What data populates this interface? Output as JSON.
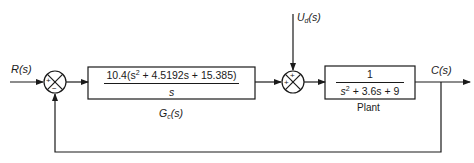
{
  "diagram": {
    "type": "block-diagram",
    "input": {
      "label": "R(s)"
    },
    "disturbance": {
      "label_main": "U",
      "label_sub": "d",
      "label_arg": "(s)"
    },
    "output": {
      "label": "C(s)"
    },
    "summing_junction_1": {
      "signs": {
        "left": "+",
        "bottom": "−"
      }
    },
    "summing_junction_2": {
      "signs": {
        "top": "+",
        "left": "+"
      }
    },
    "controller": {
      "numerator_prefix": "10.4(s",
      "numerator_exp": "2",
      "numerator_rest": " + 4.5192s + 15.385)",
      "denominator": "s",
      "label_main": "G",
      "label_sub": "c",
      "label_arg": "(s)"
    },
    "plant": {
      "numerator": "1",
      "denominator_prefix": "s",
      "denominator_exp": "2",
      "denominator_rest": " + 3.6s + 9",
      "label": "Plant"
    },
    "colors": {
      "line": "#1a1a1a",
      "background": "#ffffff"
    }
  }
}
